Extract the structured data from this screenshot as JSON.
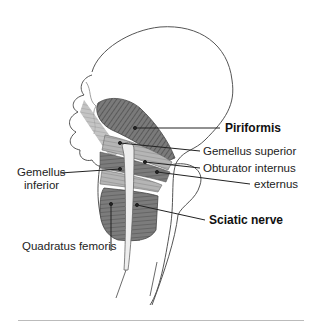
{
  "diagram": {
    "labels": {
      "piriformis": "Piriformis",
      "gemellus_superior": "Gemellus superior",
      "obturator_internus": "Obturator internus",
      "externus": "externus",
      "gemellus_inferior_line1": "Gemellus",
      "gemellus_inferior_line2": "inferior",
      "sciatic_nerve": "Sciatic nerve",
      "quadratus_femoris": "Quadratus femoris"
    },
    "colors": {
      "muscle": "#6a6a6a",
      "bone_outline": "#555555",
      "leader_line": "#222222",
      "rule": "#bbbbbb"
    }
  }
}
